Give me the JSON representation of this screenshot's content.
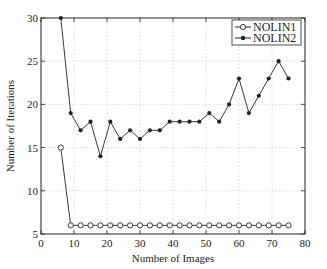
{
  "chart_data": {
    "type": "line",
    "title": "",
    "xlabel": "Number of Images",
    "ylabel": "Number of Iterations",
    "xlim": [
      0,
      80
    ],
    "ylim": [
      5,
      30
    ],
    "xticks": [
      0,
      10,
      20,
      30,
      40,
      50,
      60,
      70,
      80
    ],
    "yticks": [
      5,
      10,
      15,
      20,
      25,
      30
    ],
    "grid": true,
    "legend_position": "upper right",
    "x": [
      6,
      9,
      12,
      15,
      18,
      21,
      24,
      27,
      30,
      33,
      36,
      39,
      42,
      45,
      48,
      51,
      54,
      57,
      60,
      63,
      66,
      69,
      72,
      75
    ],
    "series": [
      {
        "name": "NOLIN1",
        "marker": "circle-open",
        "values": [
          15,
          6,
          6,
          6,
          6,
          6,
          6,
          6,
          6,
          6,
          6,
          6,
          6,
          6,
          6,
          6,
          6,
          6,
          6,
          6,
          6,
          6,
          6,
          6
        ]
      },
      {
        "name": "NOLIN2",
        "marker": "dot-filled",
        "values": [
          30,
          19,
          17,
          18,
          14,
          18,
          16,
          17,
          16,
          17,
          17,
          18,
          18,
          18,
          18,
          19,
          18,
          20,
          23,
          19,
          21,
          23,
          25,
          23
        ]
      }
    ]
  },
  "colors": {
    "line": "#222222",
    "grid": "#c8c8c8",
    "axis": "#222222"
  }
}
